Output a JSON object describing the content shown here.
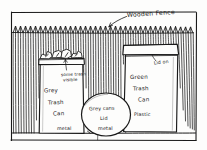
{
  "drawing": {
    "title": "Hand-drawn sketch of trash cans in front of a wooden fence",
    "medium": "pencil sketch on white paper",
    "ink_color": "#1a1a1a",
    "paper_color": "#fdfdfc"
  },
  "annotations": {
    "fence_label": "Wooden Fence",
    "trash_visible_line1": "some trash",
    "trash_visible_line2": "visible",
    "grey_can_line1": "Grey",
    "grey_can_line2": "Trash",
    "grey_can_line3": "Can",
    "grey_can_material": "metal",
    "lid_line1": "Grey  cans",
    "lid_line2": "Lid",
    "lid_line3": "metal",
    "green_can_line1": "Green",
    "green_can_line2": "Trash",
    "green_can_line3": "Can",
    "green_can_material": "Plastic",
    "green_can_lid": "Lid on"
  },
  "objects": {
    "fence": "wooden picket fence with pointed tops",
    "grey_can": "grey metal trash can, lid off, trash visible",
    "grey_lid": "round grey metal lid lying on ground",
    "green_can": "green plastic trash can with lid on",
    "ground": "ground line"
  }
}
